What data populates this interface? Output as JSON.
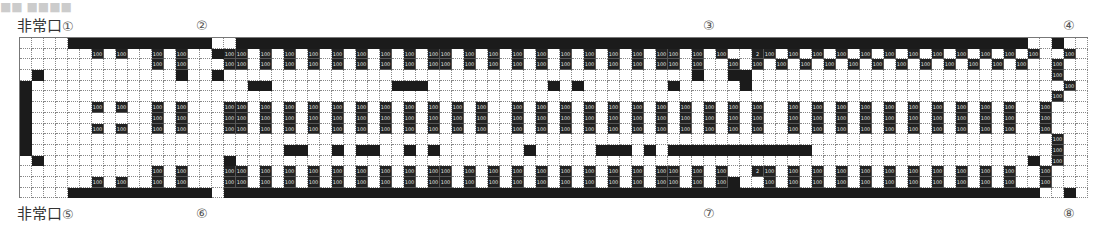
{
  "header_faded": "■■ ■■■■",
  "exits": {
    "top_left": "非常口",
    "bottom_left": "非常口"
  },
  "markers": [
    "①",
    "②",
    "③",
    "④",
    "⑤",
    "⑥",
    "⑦",
    "⑧"
  ],
  "seat_label": "100",
  "special_seat_label": "2",
  "legend": {
    ".": "empty",
    "#": "wall/blocked",
    "S": "seat 100",
    "2": "seat 2"
  },
  "grid": {
    "columns": 89,
    "rows": [
      "....############..##################################################################..#",
      "......S.S..S.S..#SS.S.S.S.S.S.S.S.SS.S.S.S.S.S.S.S.S.SS.S.S..2S.S.S.S.S.S.S.S.S.S.S.S..S",
      "...........S.S...SS.S.S.S.S.S.S.S.SS.S.S.S.S.S.S.S.S.SS.S..S.S.S.S.S.S.S.S.S.S.S.S.S..S",
      ".#...........#..#.......................................#..##.........................S",
      "#..................##..........###..........#.#.......#.....#....................... ..S",
      "#.....................................................................................S",
      "#.....S.S..S.S...SS.S.S.S.S.S.S.S.S.S.S..S.S.S.S.S.S.S.S.S.S.S..S.S.S.S.S.S.S.S.S.S..S",
      "#..........S.S...SS.S.S.S.S.S.S.S.S.S.S..S.S.S.S.S.S.S.S.S.S.S..S.S.S.S.S.S.S.S.S.S..S",
      "#.....S.S..S.S...SS.S.S.S.S.S.S.S.S.S.S..S.S.S.S.S.S.S.S.S.S.S..S.S.S.S.S.S.S.S.S.S..S",
      "#.....................................................................................S",
      "#.....................##..#.##..#.#.......#.....###.#.############....................S",
      ".#...............#..................................................................#.S",
      "...........S.S...SS.S.S.S.S.S.S.S.SS.S.S.S.S.S.S.S.S.SS.S.S..2S.S.S.S.S.S.S.S.S.S.S..S",
      "......S.S..S.S...SS.S.S.S.S.S.S.S.SS.S.S.S.S.S.S.S.S.SS.S.S#..S.S.S.S.S.S.S.S.S.S.S..S",
      "....############.####################################################################..#"
    ]
  }
}
